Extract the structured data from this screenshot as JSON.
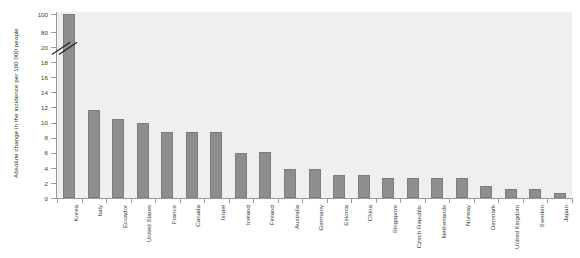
{
  "chart_data": {
    "type": "bar",
    "title": "",
    "subtitle": "",
    "xlabel": "",
    "ylabel": "Absolute change in the incidence per 100 000 people",
    "ylim": [
      0,
      100
    ],
    "grid": false,
    "legend": null,
    "axis_break": {
      "present": true,
      "between": [
        20,
        80
      ],
      "note": "y-axis broken between 20 and 80"
    },
    "ytick_labels": [
      "0",
      "2",
      "4",
      "6",
      "8",
      "10",
      "12",
      "14",
      "16",
      "18",
      "20",
      "80",
      "100"
    ],
    "ytick_values": [
      0,
      2,
      4,
      6,
      8,
      10,
      12,
      14,
      16,
      18,
      20,
      80,
      100
    ],
    "categories": [
      "Korea",
      "Italy",
      "Ecuador",
      "United States",
      "France",
      "Canada",
      "Israel",
      "Iceland",
      "Finland",
      "Australia",
      "Germany",
      "Estonia",
      "China",
      "Singapore",
      "Czech Republic",
      "Netherlands",
      "Norway",
      "Denmark",
      "United Kingdom",
      "Sweden",
      "Japan"
    ],
    "values": [
      100,
      11.6,
      10.4,
      9.9,
      8.8,
      8.8,
      8.8,
      6.0,
      6.1,
      3.9,
      3.9,
      3.0,
      3.0,
      2.6,
      2.6,
      2.6,
      2.6,
      1.6,
      1.2,
      1.2,
      0.6
    ],
    "bar_color": "#8e8e8e",
    "plot_background": "#efefef",
    "figure_background": "#ffffff",
    "axis_color": "#9a9a9a",
    "text_color": "#3a3a3a"
  }
}
